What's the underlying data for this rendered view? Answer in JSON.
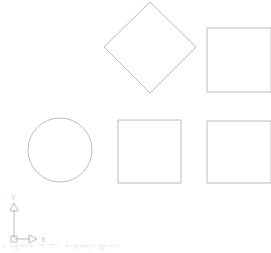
{
  "canvas": {
    "background_color": "#ffffff",
    "line_color": "#b9bcc0",
    "width": 271,
    "height": 253
  },
  "ucs_icon": {
    "name": "ucs-coordinate-icon",
    "x_label": "X",
    "y_label": "Y",
    "origin": {
      "x": 14,
      "y": 239
    },
    "label_color": "#c2c5c9"
  },
  "shapes": [
    {
      "id": "diamond-rotated-square",
      "type": "polygon",
      "label": "rotated square",
      "points": "150,2 196,47 150,93 104,47"
    },
    {
      "id": "square-top-right",
      "type": "rect",
      "label": "square",
      "x": 207,
      "y": 28,
      "width": 64,
      "height": 64
    },
    {
      "id": "circle-bottom-left",
      "type": "circle",
      "label": "circle",
      "cx": 60,
      "cy": 150,
      "r": 32
    },
    {
      "id": "square-bottom-middle",
      "type": "rect",
      "label": "square",
      "x": 118,
      "y": 120,
      "width": 63,
      "height": 63
    },
    {
      "id": "square-bottom-right",
      "type": "rect",
      "label": "square",
      "x": 207,
      "y": 121,
      "width": 64,
      "height": 62
    }
  ],
  "caption": {
    "text": "Figure 4-47   Equip grid"
  }
}
